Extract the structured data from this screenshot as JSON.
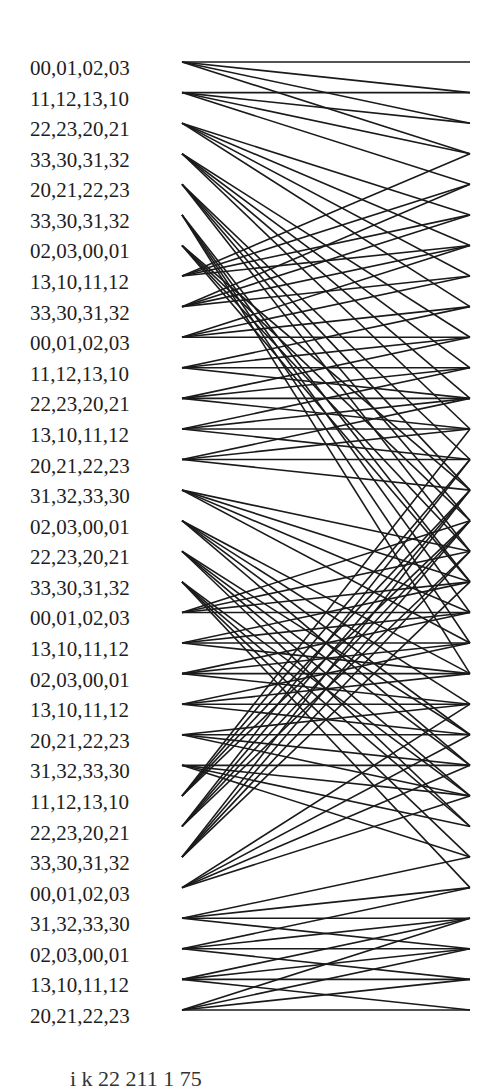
{
  "diagram": {
    "type": "bipartite-connection-graph",
    "left_x": 182,
    "right_x": 470,
    "first_row_y": 62,
    "row_spacing": 30.58,
    "line_color": "#1a1a1a",
    "line_width": 1.6,
    "fan_out": 4
  },
  "rows": [
    {
      "label": "00,01,02,03",
      "targets": [
        0,
        1,
        2,
        3
      ]
    },
    {
      "label": "11,12,13,10",
      "targets": [
        1,
        2,
        3,
        4
      ]
    },
    {
      "label": "22,23,20,21",
      "targets": [
        5,
        6,
        7,
        8
      ]
    },
    {
      "label": "33,30,31,32",
      "targets": [
        9,
        10,
        11,
        12
      ]
    },
    {
      "label": "20,21,22,23",
      "targets": [
        13,
        14,
        15,
        16
      ]
    },
    {
      "label": "33,30,31,32",
      "targets": [
        17,
        18,
        19,
        20
      ]
    },
    {
      "label": "02,03,00,01",
      "targets": [
        14,
        15,
        16,
        17
      ]
    },
    {
      "label": "13,10,11,12",
      "targets": [
        3,
        4,
        5,
        6
      ]
    },
    {
      "label": "33,30,31,32",
      "targets": [
        4,
        5,
        6,
        7
      ]
    },
    {
      "label": "00,01,02,03",
      "targets": [
        6,
        7,
        8,
        9
      ]
    },
    {
      "label": "11,12,13,10",
      "targets": [
        8,
        9,
        10,
        11
      ]
    },
    {
      "label": "22,23,20,21",
      "targets": [
        9,
        10,
        11,
        12
      ]
    },
    {
      "label": "13,10,11,12",
      "targets": [
        10,
        11,
        12,
        13
      ]
    },
    {
      "label": "20,21,22,23",
      "targets": [
        11,
        12,
        13,
        14
      ]
    },
    {
      "label": "31,32,33,30",
      "targets": [
        16,
        17,
        18,
        19
      ]
    },
    {
      "label": "02,03,00,01",
      "targets": [
        20,
        21,
        22,
        23
      ]
    },
    {
      "label": "22,23,20,21",
      "targets": [
        22,
        23,
        24,
        25
      ]
    },
    {
      "label": "33,30,31,32",
      "targets": [
        24,
        25,
        26,
        27
      ]
    },
    {
      "label": "00,01,02,03",
      "targets": [
        15,
        16,
        17,
        18
      ]
    },
    {
      "label": "13,10,11,12",
      "targets": [
        17,
        18,
        19,
        20
      ]
    },
    {
      "label": "02,03,00,01",
      "targets": [
        18,
        19,
        20,
        21
      ]
    },
    {
      "label": "13,10,11,12",
      "targets": [
        19,
        20,
        21,
        22
      ]
    },
    {
      "label": "20,21,22,23",
      "targets": [
        21,
        22,
        23,
        24
      ]
    },
    {
      "label": "31,32,33,30",
      "targets": [
        23,
        24,
        25,
        26
      ]
    },
    {
      "label": "11,12,13,10",
      "targets": [
        12,
        13,
        14,
        15
      ]
    },
    {
      "label": "22,23,20,21",
      "targets": [
        13,
        14,
        15,
        16
      ]
    },
    {
      "label": "33,30,31,32",
      "targets": [
        14,
        15,
        16,
        17
      ]
    },
    {
      "label": "00,01,02,03",
      "targets": [
        21,
        22,
        23,
        24
      ]
    },
    {
      "label": "31,32,33,30",
      "targets": [
        26,
        27,
        28,
        29
      ]
    },
    {
      "label": "02,03,00,01",
      "targets": [
        27,
        28,
        29,
        30
      ]
    },
    {
      "label": "13,10,11,12",
      "targets": [
        28,
        29,
        30,
        31
      ]
    },
    {
      "label": "20,21,22,23",
      "targets": [
        28,
        29,
        30,
        31
      ]
    }
  ],
  "caption": "i           k   22          211  1 75"
}
